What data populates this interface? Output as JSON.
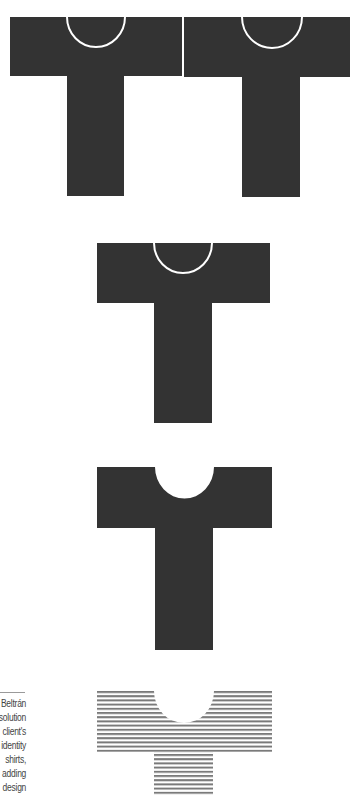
{
  "figure": {
    "colors": {
      "background": "#ffffff",
      "shirt_fill": "#333333",
      "neck_outline": "#ffffff",
      "stripe": "#7a7a7a",
      "caption_text": "#444444",
      "caption_rule": "#9a9a9a"
    },
    "shirts": [
      {
        "name": "shirt-1",
        "style": "solid-with-neck-outline"
      },
      {
        "name": "shirt-2",
        "style": "solid-with-neck-outline"
      },
      {
        "name": "shirt-3",
        "style": "solid-with-neck-outline"
      },
      {
        "name": "shirt-4",
        "style": "solid-with-neck-cutout"
      },
      {
        "name": "shirt-5",
        "style": "striped-with-neck-cutout"
      }
    ]
  },
  "caption": {
    "lines": [
      "Beltrán",
      "solution",
      "client's",
      "identity",
      "shirts,",
      "adding",
      "design"
    ]
  }
}
